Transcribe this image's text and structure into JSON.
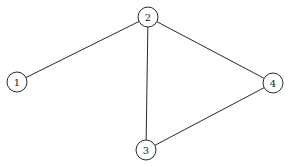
{
  "diagram": {
    "type": "undirected-graph",
    "nodes": [
      {
        "id": "1",
        "label": "1",
        "x": 17,
        "y": 82,
        "r": 10
      },
      {
        "id": "2",
        "label": "2",
        "x": 148,
        "y": 17,
        "r": 10
      },
      {
        "id": "3",
        "label": "3",
        "x": 146,
        "y": 150,
        "r": 10
      },
      {
        "id": "4",
        "label": "4",
        "x": 273,
        "y": 83,
        "r": 10
      }
    ],
    "edges": [
      {
        "from": "1",
        "to": "2"
      },
      {
        "from": "2",
        "to": "3"
      },
      {
        "from": "2",
        "to": "4"
      },
      {
        "from": "3",
        "to": "4"
      }
    ],
    "colors": {
      "stroke": "#2a2a2a",
      "fill": "#ffffff",
      "text": "#222222"
    }
  }
}
